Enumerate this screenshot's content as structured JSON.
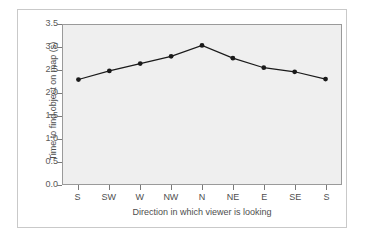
{
  "chart_data": {
    "type": "line",
    "title": "",
    "xlabel": "Direction in which viewer is looking",
    "ylabel": "Time to find object on map (s)",
    "categories": [
      "S",
      "SW",
      "W",
      "NW",
      "N",
      "NE",
      "E",
      "SE",
      "S"
    ],
    "values": [
      2.3,
      2.49,
      2.65,
      2.81,
      3.05,
      2.77,
      2.56,
      2.47,
      2.31
    ],
    "series": [
      {
        "name": "Time to find object on map",
        "values": [
          2.3,
          2.49,
          2.65,
          2.81,
          3.05,
          2.77,
          2.56,
          2.47,
          2.31
        ]
      }
    ],
    "ylim": [
      0.0,
      3.5
    ],
    "yticks": [
      "0.0",
      "0.5",
      "1.0",
      "1.5",
      "2.0",
      "2.5",
      "3.0",
      "3.5"
    ],
    "ytick_values": [
      0.0,
      0.5,
      1.0,
      1.5,
      2.0,
      2.5,
      3.0,
      3.5
    ],
    "grid": false,
    "legend": "none",
    "marker": "filled-circle",
    "line_color": "#1a1a1a",
    "marker_color": "#1a1a1a",
    "plot_background": "#efefef",
    "figure_background": "#ffffff",
    "axis_color": "#9a9a9a",
    "text_color": "#4e4e4e"
  }
}
